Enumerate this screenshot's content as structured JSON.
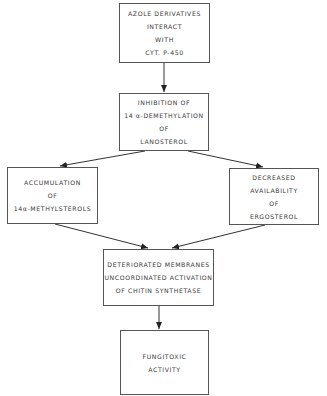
{
  "diagram": {
    "type": "flowchart",
    "nodes": [
      {
        "id": "azole",
        "lines": [
          "AZOLE DERIVATIVES",
          "INTERACT",
          "WITH",
          "CYT. P-450"
        ]
      },
      {
        "id": "inhibition",
        "lines": [
          "INHIBITION OF",
          "14 α-DEMETHYLATION",
          "OF",
          "LANOSTEROL"
        ]
      },
      {
        "id": "accumulation",
        "lines": [
          "ACCUMULATION",
          "OF",
          "14α-METHYLSTEROLS"
        ]
      },
      {
        "id": "decreased",
        "lines": [
          "DECREASED",
          "AVAILABILITY",
          "OF",
          "ERGOSTEROL"
        ]
      },
      {
        "id": "deteriorated",
        "lines": [
          "DETERIORATED MEMBRANES",
          "UNCOORDINATED ACTIVATION",
          "OF CHITIN SYNTHETASE"
        ]
      },
      {
        "id": "fungitoxic",
        "lines": [
          "FUNGITOXIC",
          "ACTIVITY"
        ]
      }
    ],
    "edges": [
      {
        "from": "azole",
        "to": "inhibition"
      },
      {
        "from": "inhibition",
        "to": "accumulation"
      },
      {
        "from": "inhibition",
        "to": "decreased"
      },
      {
        "from": "accumulation",
        "to": "deteriorated"
      },
      {
        "from": "decreased",
        "to": "deteriorated"
      },
      {
        "from": "deteriorated",
        "to": "fungitoxic"
      }
    ]
  }
}
